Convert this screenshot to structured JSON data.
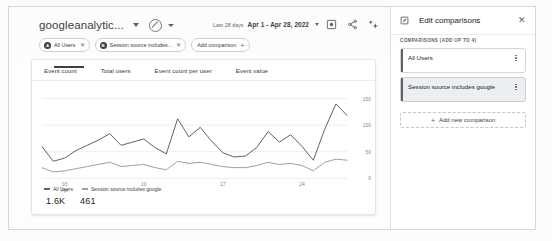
{
  "report": {
    "property_title": "googleanalytic...",
    "status_icon": "no-entry-icon",
    "date_range": {
      "label": "Last 28 days",
      "value": "Apr 1 - Apr 28, 2022"
    },
    "header_icons": [
      {
        "name": "save-icon",
        "title": "Save"
      },
      {
        "name": "share-icon",
        "title": "Share"
      },
      {
        "name": "insights-icon",
        "title": "Insights"
      }
    ],
    "chips": [
      {
        "badge": "A",
        "label": "All Users",
        "close": "✕"
      },
      {
        "badge": "B",
        "label": "Session source includes...",
        "close": "✕"
      }
    ],
    "add_comparison": "Add comparison",
    "add_comparison_plus": "+"
  },
  "card": {
    "tabs": [
      {
        "label": "Event count",
        "active": true
      },
      {
        "label": "Total users",
        "active": false
      },
      {
        "label": "Event count per user",
        "active": false
      },
      {
        "label": "Event value",
        "active": false
      }
    ],
    "legend": [
      {
        "label": "All Users",
        "value": "1.6K"
      },
      {
        "label": "Session source includes google",
        "value": "461"
      }
    ]
  },
  "chart_data": {
    "type": "line",
    "title": "Event count",
    "xlabel": "",
    "ylabel": "",
    "ylim": [
      0,
      175
    ],
    "yticks": [
      0,
      50,
      100,
      150
    ],
    "ytick_labels": [
      "0",
      "50",
      "100",
      "150"
    ],
    "grid": true,
    "legend_position": "bottom-left",
    "xtick_positions": [
      2,
      9,
      16,
      23
    ],
    "xtick_labels": [
      "03\nApr",
      "10",
      "17",
      "24"
    ],
    "x": [
      1,
      2,
      3,
      4,
      5,
      6,
      7,
      8,
      9,
      10,
      11,
      12,
      13,
      14,
      15,
      16,
      17,
      18,
      19,
      20,
      21,
      22,
      23,
      24,
      25,
      26,
      27,
      28
    ],
    "series": [
      {
        "name": "All Users",
        "total": "1.6K",
        "color": "#5f6368",
        "values": [
          60,
          32,
          38,
          52,
          62,
          72,
          84,
          62,
          68,
          74,
          58,
          46,
          112,
          78,
          96,
          70,
          48,
          40,
          42,
          58,
          88,
          68,
          82,
          60,
          34,
          92,
          140,
          118
        ]
      },
      {
        "name": "Session source includes google",
        "total": "461",
        "color": "#9aa0a6",
        "values": [
          20,
          12,
          14,
          18,
          22,
          26,
          30,
          22,
          24,
          26,
          20,
          16,
          32,
          28,
          30,
          26,
          22,
          20,
          20,
          24,
          30,
          26,
          28,
          24,
          14,
          30,
          36,
          34
        ]
      }
    ]
  },
  "panel": {
    "title": "Edit comparisons",
    "edit_icon": "pencil-square-icon",
    "close_icon": "✕",
    "section_label": "COMPARISONS (ADD UP TO 4)",
    "items": [
      {
        "label": "All Users",
        "selected": false
      },
      {
        "label": "Session source includes google",
        "selected": true
      }
    ],
    "add_new_label": "Add new comparison",
    "add_new_plus": "+"
  }
}
